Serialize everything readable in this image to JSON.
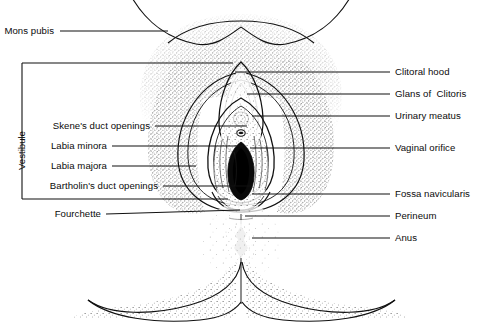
{
  "diagram": {
    "style": "black-and-white stippled line drawing",
    "ink_color": "#000000",
    "background_color": "#ffffff",
    "group_labels": [
      {
        "name": "vestibule",
        "text": "Vestibule",
        "orientation": "vertical",
        "bracket": "left-square"
      }
    ],
    "left_labels": [
      {
        "id": "mons-pubis",
        "text": "Mons pubis",
        "y": 31,
        "text_right_x": 54,
        "leader_from_x": 60,
        "leader_to_x": 168
      },
      {
        "id": "skenes-duct-openings",
        "text": "Skene's duct openings",
        "y": 126,
        "text_right_x": 150,
        "leader_from_x": 155,
        "leader_to_x": 247
      },
      {
        "id": "labia-minora",
        "text": "Labia minora",
        "y": 146,
        "text_right_x": 107,
        "leader_from_x": 112,
        "leader_to_x": 243
      },
      {
        "id": "labia-majora",
        "text": "Labia majora",
        "y": 166,
        "text_right_x": 107,
        "leader_from_x": 112,
        "leader_to_x": 196
      },
      {
        "id": "bartholins-duct-openings",
        "text": "Bartholin's duct openings",
        "y": 186,
        "text_right_x": 158,
        "leader_from_x": 163,
        "leader_to_x": 252
      },
      {
        "id": "fourchette",
        "text": "Fourchette",
        "y": 214,
        "text_right_x": 101,
        "leader_from_x": 106,
        "leader_to_x": 240
      }
    ],
    "right_labels": [
      {
        "id": "clitoral-hood",
        "text": "Clitoral hood",
        "y": 72,
        "text_left_x": 395,
        "leader_from_x": 235,
        "leader_to_x": 390
      },
      {
        "id": "glans-of-clitoris",
        "text": "Glans of  Clitoris",
        "y": 94,
        "text_left_x": 395,
        "leader_from_x": 247,
        "leader_to_x": 390
      },
      {
        "id": "urinary-meatus",
        "text": "Urinary meatus",
        "y": 116,
        "text_left_x": 395,
        "leader_from_x": 252,
        "leader_to_x": 390
      },
      {
        "id": "vaginal-orifice",
        "text": "Vaginal orifice",
        "y": 148,
        "text_left_x": 395,
        "leader_from_x": 250,
        "leader_to_x": 390
      },
      {
        "id": "fossa-navicularis",
        "text": "Fossa navicularis",
        "y": 194,
        "text_left_x": 395,
        "leader_from_x": 252,
        "leader_to_x": 390
      },
      {
        "id": "perineum",
        "text": "Perineum",
        "y": 216,
        "text_left_x": 395,
        "leader_from_x": 245,
        "leader_to_x": 390
      },
      {
        "id": "anus",
        "text": "Anus",
        "y": 238,
        "text_left_x": 395,
        "leader_from_x": 252,
        "leader_to_x": 390
      }
    ]
  }
}
